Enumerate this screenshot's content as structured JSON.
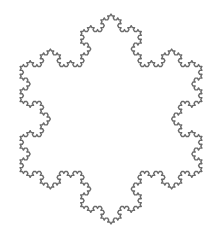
{
  "figure": {
    "title": "Koch snowflake",
    "shape": "koch-snowflake",
    "iterations": 4,
    "center": [
      111,
      119
    ],
    "radius": 105,
    "orientation": "tip-up",
    "stroke_color": "#6b6b6b",
    "stroke_width": 1.4,
    "fill_color": "#ffffff",
    "background_color": "#ffffff"
  }
}
